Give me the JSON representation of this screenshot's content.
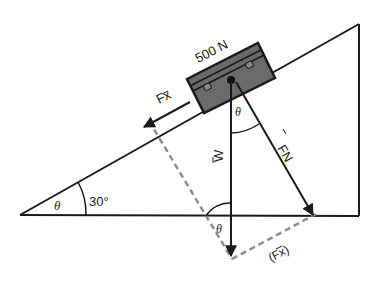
{
  "diagram": {
    "labels": {
      "weight_value": "500 N",
      "force_parallel": "F⃗x",
      "force_parallel_text": "Fx",
      "force_normal_text": "FN",
      "weight_text": "W",
      "force_parallel_dashed_text": "(Fx)",
      "theta": "θ",
      "angle_value": "30°"
    },
    "colors": {
      "line": "#1a1a1a",
      "box_fill": "#6b6b6b",
      "dashed": "#8c8c8c",
      "background": "#ffffff"
    },
    "geometry": {
      "incline_angle_deg": 30
    }
  }
}
